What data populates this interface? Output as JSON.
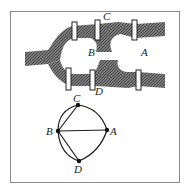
{
  "figure": {
    "map": {
      "labels": {
        "A": "A",
        "B": "B",
        "C": "C",
        "D": "D"
      },
      "river_color": "#6a6a6a",
      "bridge_count": 7
    },
    "graph": {
      "nodes": [
        {
          "id": "A",
          "label": "A",
          "x": 107,
          "y": 130
        },
        {
          "id": "B",
          "label": "B",
          "x": 58,
          "y": 131
        },
        {
          "id": "C",
          "label": "C",
          "x": 78,
          "y": 105
        },
        {
          "id": "D",
          "label": "D",
          "x": 79,
          "y": 161
        }
      ],
      "edges": [
        [
          "B",
          "C"
        ],
        [
          "B",
          "C"
        ],
        [
          "B",
          "D"
        ],
        [
          "B",
          "D"
        ],
        [
          "B",
          "A"
        ],
        [
          "C",
          "A"
        ],
        [
          "D",
          "A"
        ]
      ],
      "line_color": "#1a1a1a"
    }
  }
}
